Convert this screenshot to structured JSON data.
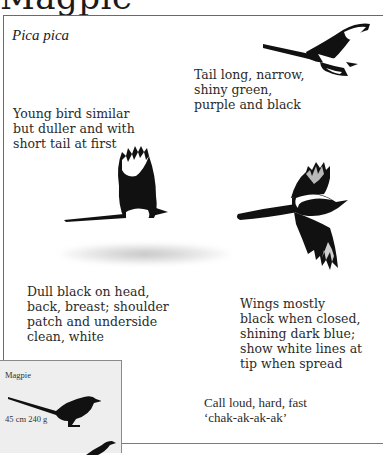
{
  "page": {
    "title": "Magpie",
    "latin_name": "Pica pica"
  },
  "notes": {
    "tail": "Tail long, narrow,\nshiny green,\npurple and black",
    "young": "Young bird similar\nbut duller and with\nshort tail at first",
    "plumage": "Dull black on head,\nback, breast; shoulder\npatch and underside\nclean, white",
    "wings": "Wings mostly\nblack when closed,\nshining dark blue;\nshow white lines at\ntip when spread",
    "call": "Call loud, hard, fast\n‘chak-ak-ak-ak’"
  },
  "inset": {
    "name": "Magpie",
    "size": "45 cm  240 g"
  },
  "illustrations": [
    {
      "name": "magpie-flying-top-right"
    },
    {
      "name": "magpie-flying-center-left"
    },
    {
      "name": "magpie-flying-spread-right"
    },
    {
      "name": "magpie-silhouette-perched"
    },
    {
      "name": "magpie-silhouette-partial"
    }
  ],
  "colors": {
    "ink": "#111111",
    "white_patch": "#ffffff",
    "inset_bg": "#eeeeee",
    "frame": "#6a6a6a"
  }
}
